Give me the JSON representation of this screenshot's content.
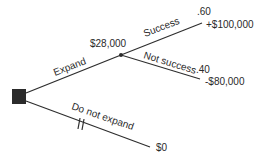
{
  "diagram": {
    "type": "decision-tree",
    "decision_node": {
      "shape": "square",
      "color": "#2b2b2b"
    },
    "chance_node": {
      "expected_value": "$28,000"
    },
    "branches": {
      "expand": {
        "label": "Expand"
      },
      "not_expand": {
        "label": "Do not expand",
        "payoff": "$0",
        "pruned": true
      }
    },
    "outcomes": [
      {
        "label": "Success",
        "probability": ".60",
        "payoff": "+$100,000"
      },
      {
        "label": "Not success",
        "probability": ".40",
        "payoff": "-$80,000"
      }
    ]
  }
}
